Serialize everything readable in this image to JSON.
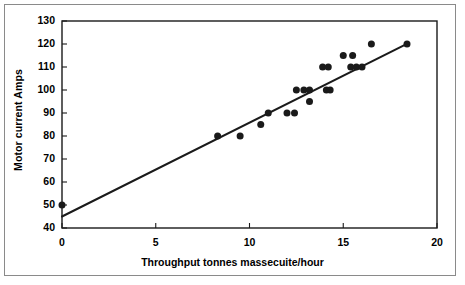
{
  "chart_data": {
    "type": "scatter",
    "title": "",
    "xlabel": "Throughput tonnes massecuite/hour",
    "ylabel": "Motor current Amps",
    "xlim": [
      0,
      20
    ],
    "ylim": [
      40,
      130
    ],
    "xticks": [
      0,
      5,
      10,
      15,
      20
    ],
    "yticks": [
      40,
      50,
      60,
      70,
      80,
      90,
      100,
      110,
      120,
      130
    ],
    "xtick_labels": [
      "0",
      "5",
      "10",
      "15",
      "20"
    ],
    "ytick_labels": [
      "40",
      "50",
      "60",
      "70",
      "80",
      "90",
      "100",
      "110",
      "120",
      "130"
    ],
    "grid": false,
    "legend": null,
    "marker": {
      "shape": "circle",
      "color": "#1a1a1a",
      "size_px": 7
    },
    "points": [
      {
        "x": 0.0,
        "y": 50
      },
      {
        "x": 8.3,
        "y": 80
      },
      {
        "x": 9.5,
        "y": 80
      },
      {
        "x": 10.6,
        "y": 85
      },
      {
        "x": 11.0,
        "y": 90
      },
      {
        "x": 12.0,
        "y": 90
      },
      {
        "x": 12.4,
        "y": 90
      },
      {
        "x": 12.5,
        "y": 100
      },
      {
        "x": 12.9,
        "y": 100
      },
      {
        "x": 13.2,
        "y": 100
      },
      {
        "x": 13.2,
        "y": 95
      },
      {
        "x": 13.9,
        "y": 110
      },
      {
        "x": 14.2,
        "y": 110
      },
      {
        "x": 14.1,
        "y": 100
      },
      {
        "x": 14.3,
        "y": 100
      },
      {
        "x": 15.0,
        "y": 115
      },
      {
        "x": 15.5,
        "y": 115
      },
      {
        "x": 15.4,
        "y": 110
      },
      {
        "x": 15.7,
        "y": 110
      },
      {
        "x": 16.0,
        "y": 110
      },
      {
        "x": 16.5,
        "y": 120
      },
      {
        "x": 18.4,
        "y": 120
      }
    ],
    "trend_line": {
      "type": "linear",
      "color": "#1a1a1a",
      "width_px": 2,
      "x_start": 0.0,
      "y_start": 45,
      "x_end": 18.5,
      "y_end": 120.5,
      "slope": 4.08,
      "intercept": 45
    },
    "axis": {
      "color": "#1a1a1a",
      "frame_color": "#8a8a8a",
      "background": "#ffffff"
    }
  }
}
